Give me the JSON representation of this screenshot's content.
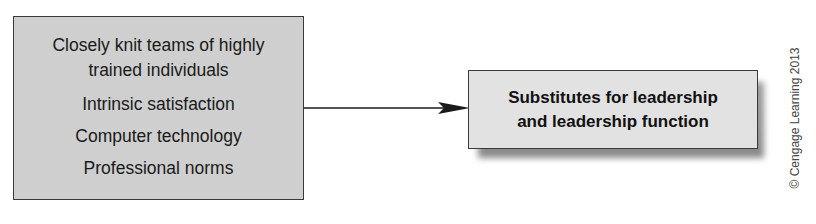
{
  "diagram": {
    "source_box": {
      "items": [
        "Closely knit teams of highly trained individuals",
        "Intrinsic satisfaction",
        "Computer technology",
        "Professional norms"
      ],
      "first_item_lines": [
        "Closely knit teams of highly",
        "trained individuals"
      ]
    },
    "target_box": {
      "lines": [
        "Substitutes for leadership",
        "and leadership function"
      ]
    },
    "connector": "arrow from source_box to target_box",
    "copyright": "© Cengage Learning 2013",
    "colors": {
      "source_fill": "#cfcfcf",
      "target_fill": "#e2e2e2",
      "border": "#3a3a3a",
      "text": "#1a1a1a"
    }
  }
}
